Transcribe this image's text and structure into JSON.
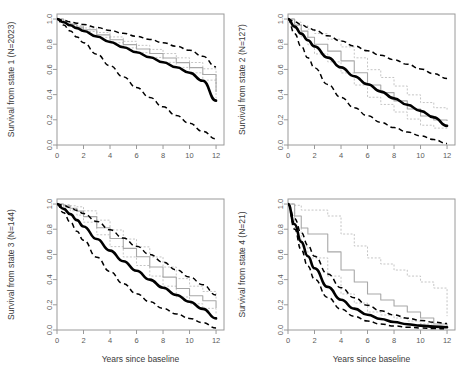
{
  "figure": {
    "layout": "2x2 grid of survival curve panels",
    "xlabel": "Years since baseline",
    "xticks": [
      "0",
      "2",
      "4",
      "6",
      "8",
      "10",
      "12"
    ],
    "yticks": [
      "0.0",
      "0.2",
      "0.4",
      "0.6",
      "0.8",
      "1.0"
    ],
    "xlim": [
      0,
      12.6
    ],
    "ylim": [
      0,
      1.04
    ],
    "colors": {
      "fit": "#000000",
      "confidence_band": "#000000",
      "kaplan_meier": "#a8a8a8",
      "kaplan_meier_ci": "#c2c2c2",
      "axis": "#9a9a9a"
    }
  },
  "chart_data": [
    {
      "type": "line",
      "panel": 1,
      "ylabel": "Survival from state 1 (N=2023)",
      "xlabel": "",
      "title": "",
      "xlim": [
        0,
        12.6
      ],
      "ylim": [
        0,
        1.04
      ],
      "xticks": [
        0,
        2,
        4,
        6,
        8,
        10,
        12
      ],
      "yticks": [
        0.0,
        0.2,
        0.4,
        0.6,
        0.8,
        1.0
      ],
      "grid": false,
      "legend": "none",
      "x": [
        0,
        0.5,
        1,
        1.5,
        2,
        3,
        4,
        5,
        6,
        7,
        8,
        9,
        10,
        11,
        12
      ],
      "series": [
        {
          "name": "Model fit",
          "style": "solid-black-thick",
          "values": [
            1.0,
            0.975,
            0.951,
            0.928,
            0.905,
            0.861,
            0.818,
            0.776,
            0.736,
            0.697,
            0.657,
            0.617,
            0.573,
            0.51,
            0.352
          ]
        },
        {
          "name": "Upper confidence limit",
          "style": "dashed-black",
          "values": [
            1.0,
            0.989,
            0.978,
            0.967,
            0.956,
            0.933,
            0.91,
            0.887,
            0.863,
            0.838,
            0.812,
            0.784,
            0.752,
            0.704,
            0.62
          ]
        },
        {
          "name": "Lower confidence limit",
          "style": "dashed-black",
          "values": [
            1.0,
            0.952,
            0.905,
            0.858,
            0.812,
            0.72,
            0.629,
            0.541,
            0.457,
            0.378,
            0.303,
            0.234,
            0.172,
            0.108,
            0.048
          ]
        },
        {
          "name": "Kaplan-Meier estimate",
          "style": "solid-gray-step",
          "values": [
            1.0,
            0.979,
            0.957,
            0.936,
            0.915,
            0.874,
            0.835,
            0.797,
            0.762,
            0.727,
            0.691,
            0.654,
            0.614,
            0.56,
            0.42
          ]
        },
        {
          "name": "Kaplan-Meier upper CI",
          "style": "dotted-gray",
          "values": [
            1.0,
            0.983,
            0.965,
            0.947,
            0.929,
            0.893,
            0.858,
            0.823,
            0.791,
            0.759,
            0.726,
            0.692,
            0.655,
            0.605,
            0.47
          ]
        },
        {
          "name": "Kaplan-Meier lower CI",
          "style": "dotted-gray",
          "values": [
            1.0,
            0.975,
            0.949,
            0.925,
            0.901,
            0.855,
            0.812,
            0.771,
            0.733,
            0.695,
            0.656,
            0.616,
            0.573,
            0.515,
            0.372
          ]
        }
      ]
    },
    {
      "type": "line",
      "panel": 2,
      "ylabel": "Survival from state 2 (N=127)",
      "xlabel": "",
      "title": "",
      "xlim": [
        0,
        12.6
      ],
      "ylim": [
        0,
        1.04
      ],
      "xticks": [
        0,
        2,
        4,
        6,
        8,
        10,
        12
      ],
      "yticks": [
        0.0,
        0.2,
        0.4,
        0.6,
        0.8,
        1.0
      ],
      "grid": false,
      "legend": "none",
      "x": [
        0,
        0.5,
        1,
        1.5,
        2,
        3,
        4,
        5,
        6,
        7,
        8,
        9,
        10,
        11,
        12
      ],
      "series": [
        {
          "name": "Model fit",
          "style": "solid-black-thick",
          "values": [
            1.0,
            0.94,
            0.884,
            0.832,
            0.783,
            0.694,
            0.616,
            0.546,
            0.482,
            0.424,
            0.37,
            0.319,
            0.271,
            0.219,
            0.152
          ]
        },
        {
          "name": "Upper confidence limit",
          "style": "dashed-black",
          "values": [
            1.0,
            0.978,
            0.956,
            0.934,
            0.912,
            0.868,
            0.826,
            0.786,
            0.748,
            0.712,
            0.677,
            0.641,
            0.604,
            0.566,
            0.528
          ]
        },
        {
          "name": "Lower confidence limit",
          "style": "dashed-black",
          "values": [
            1.0,
            0.884,
            0.782,
            0.692,
            0.613,
            0.481,
            0.378,
            0.296,
            0.232,
            0.18,
            0.138,
            0.103,
            0.073,
            0.043,
            0.012
          ]
        },
        {
          "name": "Kaplan-Meier estimate",
          "style": "solid-gray-step",
          "values": [
            1.0,
            0.952,
            0.904,
            0.856,
            0.8,
            0.745,
            0.668,
            0.574,
            0.476,
            0.416,
            0.35,
            0.286,
            0.23,
            0.199,
            0.19
          ]
        },
        {
          "name": "Kaplan-Meier upper CI",
          "style": "dotted-gray",
          "values": [
            1.0,
            0.975,
            0.948,
            0.92,
            0.885,
            0.84,
            0.779,
            0.692,
            0.598,
            0.536,
            0.468,
            0.398,
            0.337,
            0.296,
            0.281
          ]
        },
        {
          "name": "Kaplan-Meier lower CI",
          "style": "dotted-gray",
          "values": [
            1.0,
            0.925,
            0.858,
            0.796,
            0.723,
            0.66,
            0.572,
            0.476,
            0.379,
            0.322,
            0.262,
            0.206,
            0.157,
            0.134,
            0.128
          ]
        }
      ]
    },
    {
      "type": "line",
      "panel": 3,
      "ylabel": "Survival from state 3 (N=144)",
      "xlabel": "Years since baseline",
      "title": "",
      "xlim": [
        0,
        12.6
      ],
      "ylim": [
        0,
        1.04
      ],
      "xticks": [
        0,
        2,
        4,
        6,
        8,
        10,
        12
      ],
      "yticks": [
        0.0,
        0.2,
        0.4,
        0.6,
        0.8,
        1.0
      ],
      "grid": false,
      "legend": "none",
      "x": [
        0,
        0.5,
        1,
        1.5,
        2,
        3,
        4,
        5,
        6,
        7,
        8,
        9,
        10,
        11,
        12
      ],
      "series": [
        {
          "name": "Model fit",
          "style": "solid-black-thick",
          "values": [
            1.0,
            0.962,
            0.92,
            0.872,
            0.822,
            0.722,
            0.63,
            0.546,
            0.47,
            0.4,
            0.336,
            0.278,
            0.224,
            0.168,
            0.092
          ]
        },
        {
          "name": "Upper confidence limit",
          "style": "dashed-black",
          "values": [
            1.0,
            0.988,
            0.972,
            0.95,
            0.924,
            0.862,
            0.796,
            0.73,
            0.664,
            0.6,
            0.538,
            0.478,
            0.42,
            0.36,
            0.278
          ]
        },
        {
          "name": "Lower confidence limit",
          "style": "dashed-black",
          "values": [
            1.0,
            0.93,
            0.858,
            0.784,
            0.712,
            0.578,
            0.464,
            0.368,
            0.288,
            0.224,
            0.172,
            0.128,
            0.092,
            0.058,
            0.016
          ]
        },
        {
          "name": "Kaplan-Meier estimate",
          "style": "solid-gray-step",
          "values": [
            1.0,
            0.986,
            0.966,
            0.944,
            0.9,
            0.812,
            0.726,
            0.648,
            0.582,
            0.5,
            0.42,
            0.33,
            0.272,
            0.232,
            0.175
          ]
        },
        {
          "name": "Kaplan-Meier upper CI",
          "style": "dotted-gray",
          "values": [
            1.0,
            0.996,
            0.986,
            0.978,
            0.946,
            0.872,
            0.794,
            0.722,
            0.66,
            0.58,
            0.5,
            0.408,
            0.348,
            0.306,
            0.246
          ]
        },
        {
          "name": "Kaplan-Meier lower CI",
          "style": "dotted-gray",
          "values": [
            1.0,
            0.974,
            0.946,
            0.912,
            0.856,
            0.756,
            0.662,
            0.58,
            0.512,
            0.428,
            0.348,
            0.262,
            0.208,
            0.172,
            0.122
          ]
        }
      ]
    },
    {
      "type": "line",
      "panel": 4,
      "ylabel": "Survival from state 4 (N=21)",
      "xlabel": "Years since baseline",
      "title": "",
      "xlim": [
        0,
        12.6
      ],
      "ylim": [
        0,
        1.04
      ],
      "xticks": [
        0,
        2,
        4,
        6,
        8,
        10,
        12
      ],
      "yticks": [
        0.0,
        0.2,
        0.4,
        0.6,
        0.8,
        1.0
      ],
      "grid": false,
      "legend": "none",
      "x": [
        0,
        0.5,
        1,
        1.5,
        2,
        3,
        4,
        5,
        6,
        7,
        8,
        9,
        10,
        11,
        12
      ],
      "series": [
        {
          "name": "Model fit",
          "style": "solid-black-thick",
          "values": [
            1.0,
            0.84,
            0.7,
            0.585,
            0.49,
            0.342,
            0.24,
            0.17,
            0.121,
            0.087,
            0.063,
            0.046,
            0.035,
            0.027,
            0.022
          ]
        },
        {
          "name": "Upper confidence limit",
          "style": "dashed-black",
          "values": [
            1.0,
            0.884,
            0.772,
            0.672,
            0.586,
            0.444,
            0.336,
            0.256,
            0.196,
            0.152,
            0.119,
            0.094,
            0.076,
            0.062,
            0.052
          ]
        },
        {
          "name": "Lower confidence limit",
          "style": "dashed-black",
          "values": [
            1.0,
            0.8,
            0.636,
            0.506,
            0.404,
            0.258,
            0.166,
            0.108,
            0.071,
            0.047,
            0.032,
            0.022,
            0.016,
            0.012,
            0.009
          ]
        },
        {
          "name": "Kaplan-Meier estimate",
          "style": "solid-gray-step",
          "values": [
            1.0,
            0.905,
            0.81,
            0.762,
            0.762,
            0.62,
            0.476,
            0.381,
            0.286,
            0.238,
            0.19,
            0.143,
            0.095,
            0.048,
            0.024
          ]
        },
        {
          "name": "Kaplan-Meier upper CI",
          "style": "dotted-gray",
          "values": [
            1.0,
            0.99,
            0.952,
            0.952,
            0.952,
            0.905,
            0.762,
            0.667,
            0.572,
            0.524,
            0.476,
            0.428,
            0.381,
            0.333,
            0.11
          ]
        },
        {
          "name": "Kaplan-Meier lower CI",
          "style": "dotted-gray",
          "values": [
            1.0,
            0.81,
            0.667,
            0.572,
            0.572,
            0.428,
            0.286,
            0.214,
            0.143,
            0.119,
            0.095,
            0.071,
            0.048,
            0.024,
            0.01
          ]
        }
      ]
    }
  ]
}
